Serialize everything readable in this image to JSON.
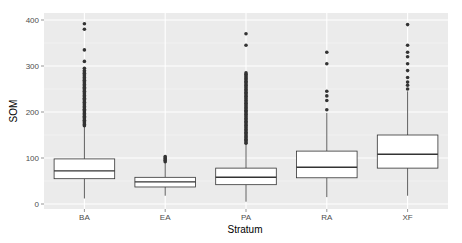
{
  "chart_data": {
    "type": "boxplot",
    "title": "",
    "xlabel": "Stratum",
    "ylabel": "SOM",
    "ylim": [
      -5,
      410
    ],
    "yticks": [
      0,
      100,
      200,
      300,
      400
    ],
    "grid": true,
    "legend": "none",
    "categories": [
      "BA",
      "EA",
      "PA",
      "RA",
      "XF"
    ],
    "boxes": [
      {
        "category": "BA",
        "whisker_low": 12,
        "q1": 55,
        "median": 72,
        "q3": 98,
        "whisker_high": 168,
        "outliers_range": [
          170,
          290
        ],
        "outliers": [
          295,
          310,
          335,
          380,
          392
        ]
      },
      {
        "category": "EA",
        "whisker_low": 18,
        "q1": 37,
        "median": 48,
        "q3": 58,
        "whisker_high": 90,
        "outliers": [
          92,
          95,
          98,
          100,
          103
        ]
      },
      {
        "category": "PA",
        "whisker_low": 5,
        "q1": 42,
        "median": 58,
        "q3": 78,
        "whisker_high": 130,
        "outliers_range": [
          132,
          285
        ],
        "outliers": [
          345,
          370
        ]
      },
      {
        "category": "RA",
        "whisker_low": 15,
        "q1": 57,
        "median": 80,
        "q3": 115,
        "whisker_high": 198,
        "outliers": [
          205,
          225,
          235,
          245,
          305,
          330
        ]
      },
      {
        "category": "XF",
        "whisker_low": 18,
        "q1": 78,
        "median": 108,
        "q3": 150,
        "whisker_high": 245,
        "outliers": [
          250,
          258,
          265,
          275,
          290,
          305,
          320,
          330,
          345,
          390
        ]
      }
    ]
  }
}
